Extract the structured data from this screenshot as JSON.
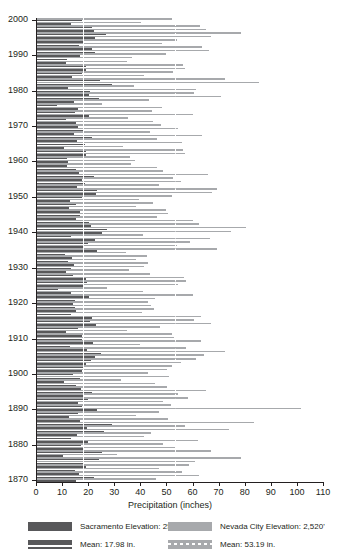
{
  "chart_data": {
    "type": "bar",
    "orientation": "horizontal",
    "title": "",
    "xlabel": "Precipitation (inches)",
    "ylabel": "",
    "xlim": [
      0,
      110
    ],
    "ylim": [
      1870,
      2000
    ],
    "xticks": [
      0,
      10,
      20,
      30,
      40,
      50,
      60,
      70,
      80,
      90,
      100,
      110
    ],
    "yticks": [
      1870,
      1880,
      1890,
      1900,
      1910,
      1920,
      1930,
      1940,
      1950,
      1960,
      1970,
      1980,
      1990,
      2000
    ],
    "grid": false,
    "legend_position": "bottom",
    "annotations": [
      {
        "label": "Mean: 17.98 in.",
        "value": 17.98,
        "style": "solid-white-line",
        "series": "Sacramento Elevation: 25'"
      },
      {
        "label": "Mean: 53.19 in.",
        "value": 53.19,
        "style": "dashed-white-line",
        "series": "Nevada City Elevation: 2,520'"
      }
    ],
    "categories": [
      1870,
      1871,
      1872,
      1873,
      1874,
      1875,
      1876,
      1877,
      1878,
      1879,
      1880,
      1881,
      1882,
      1883,
      1884,
      1885,
      1886,
      1887,
      1888,
      1889,
      1890,
      1891,
      1892,
      1893,
      1894,
      1895,
      1896,
      1897,
      1898,
      1899,
      1900,
      1901,
      1902,
      1903,
      1904,
      1905,
      1906,
      1907,
      1908,
      1909,
      1910,
      1911,
      1912,
      1913,
      1914,
      1915,
      1916,
      1917,
      1918,
      1919,
      1920,
      1921,
      1922,
      1923,
      1924,
      1925,
      1926,
      1927,
      1928,
      1929,
      1930,
      1931,
      1932,
      1933,
      1934,
      1935,
      1936,
      1937,
      1938,
      1939,
      1940,
      1941,
      1942,
      1943,
      1944,
      1945,
      1946,
      1947,
      1948,
      1949,
      1950,
      1951,
      1952,
      1953,
      1954,
      1955,
      1956,
      1957,
      1958,
      1959,
      1960,
      1961,
      1962,
      1963,
      1964,
      1965,
      1966,
      1967,
      1968,
      1969,
      1970,
      1971,
      1972,
      1973,
      1974,
      1975,
      1976,
      1977,
      1978,
      1979,
      1980,
      1981,
      1982,
      1983,
      1984,
      1985,
      1986,
      1987,
      1988,
      1989,
      1990,
      1991,
      1992,
      1993,
      1994,
      1995,
      1996,
      1997,
      1998,
      1999,
      2000
    ],
    "series": [
      {
        "name": "Sacramento Elevation: 25'",
        "color": "#58585a",
        "mean": 17.98,
        "values": [
          15.3,
          22.4,
          16.5,
          14.8,
          19.2,
          18.5,
          24.1,
          10.2,
          25.3,
          18.0,
          17.1,
          19.8,
          13.4,
          15.6,
          26.2,
          19.5,
          29.3,
          16.8,
          12.6,
          16.2,
          23.4,
          17.5,
          16.0,
          19.8,
          18.4,
          21.6,
          17.2,
          15.5,
          10.8,
          17.0,
          14.2,
          17.8,
          17.9,
          19.1,
          21.0,
          22.5,
          24.8,
          19.4,
          13.2,
          21.8,
          17.6,
          17.5,
          11.4,
          16.0,
          22.9,
          20.6,
          21.6,
          13.5,
          15.2,
          14.8,
          14.2,
          15.1,
          20.4,
          13.6,
          8.6,
          18.2,
          19.5,
          19.3,
          14.2,
          11.6,
          13.5,
          14.7,
          12.2,
          13.8,
          11.0,
          23.5,
          18.2,
          20.1,
          22.6,
          13.4,
          25.4,
          27.3,
          21.2,
          20.3,
          15.3,
          16.8,
          16.9,
          12.6,
          15.3,
          13.0,
          17.8,
          22.9,
          23.5,
          15.7,
          18.6,
          17.7,
          22.4,
          16.3,
          15.5,
          12.0,
          12.4,
          11.8,
          19.3,
          19.2,
          10.8,
          18.8,
          15.6,
          21.6,
          14.4,
          18.4,
          16.1,
          15.2,
          11.5,
          20.3,
          15.0,
          16.2,
          7.9,
          14.6,
          24.1,
          20.5,
          20.7,
          12.3,
          29.1,
          24.6,
          13.7,
          17.8,
          19.3,
          19.2,
          11.4,
          12.0,
          16.8,
          22.5,
          21.6,
          16.3,
          18.3,
          22.8,
          26.7,
          22.1,
          21.3,
          13.4,
          17.5
        ]
      },
      {
        "name": "Nevada City Elevation: 2,520'",
        "color": "#a7a9ac",
        "mean": 53.19,
        "values": [
          45.8,
          62.5,
          56.0,
          47.3,
          58.5,
          60.8,
          78.4,
          31.2,
          67.0,
          53.1,
          48.6,
          62.0,
          41.3,
          44.0,
          73.8,
          57.2,
          83.5,
          50.4,
          38.5,
          47.2,
          101.4,
          51.9,
          48.8,
          58.2,
          54.5,
          65.3,
          50.2,
          45.6,
          32.5,
          50.8,
          43.0,
          50.3,
          52.1,
          55.6,
          61.5,
          64.2,
          72.6,
          57.5,
          39.8,
          63.4,
          53.0,
          52.3,
          34.8,
          47.5,
          67.2,
          60.5,
          63.4,
          40.7,
          45.2,
          44.0,
          42.8,
          45.6,
          60.3,
          41.2,
          27.1,
          54.6,
          57.4,
          56.8,
          43.5,
          35.8,
          41.4,
          43.0,
          38.2,
          42.6,
          34.5,
          69.5,
          54.0,
          59.0,
          66.5,
          41.0,
          74.8,
          80.5,
          62.3,
          60.0,
          46.5,
          50.4,
          49.8,
          38.2,
          45.0,
          39.4,
          52.2,
          67.5,
          69.2,
          47.0,
          55.4,
          52.6,
          66.0,
          48.8,
          46.2,
          36.5,
          37.8,
          36.2,
          57.0,
          56.5,
          33.2,
          55.8,
          46.3,
          63.5,
          43.6,
          54.3,
          47.8,
          45.0,
          35.2,
          60.0,
          44.5,
          48.2,
          25.4,
          43.4,
          70.8,
          60.4,
          61.2,
          37.5,
          85.5,
          72.4,
          41.5,
          52.5,
          57.0,
          56.5,
          35.0,
          36.8,
          50.0,
          66.2,
          63.6,
          48.4,
          54.2,
          67.0,
          78.5,
          65.1,
          62.8,
          40.2,
          52.0
        ]
      }
    ]
  },
  "axis": {
    "x_title": "Precipitation (inches)",
    "x_tick_labels": [
      "0",
      "10",
      "20",
      "30",
      "40",
      "50",
      "60",
      "70",
      "80",
      "90",
      "100",
      "110"
    ],
    "y_tick_labels": [
      "1870",
      "1880",
      "1890",
      "1900",
      "1910",
      "1920",
      "1930",
      "1940",
      "1950",
      "1960",
      "1970",
      "1980",
      "1990",
      "2000"
    ]
  },
  "legend": {
    "items": [
      {
        "id": "sac-bar",
        "swatch": "sac",
        "label": "Sacramento Elevation: 25'"
      },
      {
        "id": "nev-bar",
        "swatch": "nev",
        "label": "Nevada City Elevation: 2,520'"
      },
      {
        "id": "sac-mean",
        "swatch": "meansac",
        "label": "Mean: 17.98 in."
      },
      {
        "id": "nev-mean",
        "swatch": "meannev",
        "label": "Mean: 53.19 in."
      }
    ]
  },
  "colors": {
    "sacramento": "#58585a",
    "nevada_city": "#a7a9ac",
    "axis": "#231f20",
    "mean_line": "#ffffff",
    "background": "#ffffff"
  }
}
